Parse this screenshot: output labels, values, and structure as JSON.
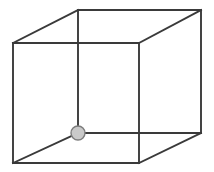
{
  "figure": {
    "type": "line-drawing",
    "canvas": {
      "width": 214,
      "height": 172,
      "background": "#ffffff"
    },
    "style": {
      "edge_color": "#3a3a3a",
      "edge_width": 1.9,
      "marker_fill": "#c9c9c9",
      "marker_stroke": "#7d7d7d",
      "marker_radius": 7
    },
    "vertices": {
      "front_top_left": {
        "id": "A",
        "x": 13,
        "y": 43
      },
      "front_top_right": {
        "id": "B",
        "x": 139,
        "y": 43
      },
      "front_bottom_left": {
        "id": "C",
        "x": 13,
        "y": 163
      },
      "front_bottom_right": {
        "id": "D",
        "x": 139,
        "y": 163
      },
      "back_top_left": {
        "id": "E",
        "x": 78,
        "y": 10
      },
      "back_top_right": {
        "id": "F",
        "x": 201,
        "y": 10
      },
      "back_bottom_left": {
        "id": "G",
        "x": 78,
        "y": 133
      },
      "back_bottom_right": {
        "id": "H",
        "x": 201,
        "y": 133
      }
    },
    "edges": [
      {
        "name": "front-top",
        "from": "front_top_left",
        "to": "front_top_right"
      },
      {
        "name": "front-left",
        "from": "front_top_left",
        "to": "front_bottom_left"
      },
      {
        "name": "front-right",
        "from": "front_top_right",
        "to": "front_bottom_right"
      },
      {
        "name": "front-bottom",
        "from": "front_bottom_left",
        "to": "front_bottom_right"
      },
      {
        "name": "back-top",
        "from": "back_top_left",
        "to": "back_top_right"
      },
      {
        "name": "back-left",
        "from": "back_top_left",
        "to": "back_bottom_left"
      },
      {
        "name": "back-right",
        "from": "back_top_right",
        "to": "back_bottom_right"
      },
      {
        "name": "back-bottom",
        "from": "back_bottom_left",
        "to": "back_bottom_right"
      },
      {
        "name": "connector-top-left",
        "from": "front_top_left",
        "to": "back_top_left"
      },
      {
        "name": "connector-top-right",
        "from": "front_top_right",
        "to": "back_top_right"
      },
      {
        "name": "connector-bot-left",
        "from": "front_bottom_left",
        "to": "back_bottom_left"
      },
      {
        "name": "connector-bot-right",
        "from": "front_bottom_right",
        "to": "back_bottom_right"
      }
    ],
    "marker": {
      "label": "marked-vertex",
      "at": "back_bottom_left",
      "x": 78,
      "y": 133,
      "r": 7
    }
  }
}
